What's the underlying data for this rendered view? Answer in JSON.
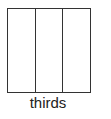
{
  "diagram": {
    "label": "thirds",
    "parts": 3,
    "line_color": "#333333"
  }
}
